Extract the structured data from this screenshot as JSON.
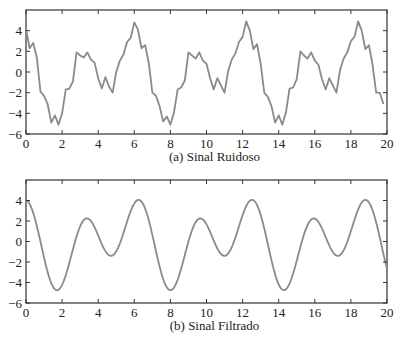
{
  "figure": {
    "width": 405,
    "height": 344,
    "line_color": "#8a8a8a",
    "axis_color": "#333333"
  },
  "chart_data": [
    {
      "type": "line",
      "title": "",
      "caption": "(a)  Sinal Ruidoso",
      "xlabel": "",
      "ylabel": "",
      "xlim": [
        0,
        20
      ],
      "ylim": [
        -6,
        6
      ],
      "grid": false,
      "xticks": [
        0,
        2,
        4,
        6,
        8,
        10,
        12,
        14,
        16,
        18,
        20
      ],
      "yticks": [
        -6,
        -4,
        -2,
        0,
        2,
        4
      ],
      "box": {
        "left": 26,
        "top": 10,
        "right": 387,
        "bottom": 134
      },
      "series": [
        {
          "name": "Sinal Ruidoso",
          "x": [
            0,
            0.2,
            0.4,
            0.6,
            0.8,
            1.0,
            1.2,
            1.4,
            1.6,
            1.8,
            2.0,
            2.2,
            2.4,
            2.6,
            2.8,
            3.0,
            3.2,
            3.4,
            3.6,
            3.8,
            4.0,
            4.2,
            4.4,
            4.6,
            4.8,
            5.0,
            5.2,
            5.4,
            5.6,
            5.8,
            6.0,
            6.2,
            6.4,
            6.6,
            6.8,
            7.0,
            7.2,
            7.4,
            7.6,
            7.8,
            8.0,
            8.2,
            8.4,
            8.6,
            8.8,
            9.0,
            9.2,
            9.4,
            9.6,
            9.8,
            10.0,
            10.2,
            10.4,
            10.6,
            10.8,
            11.0,
            11.2,
            11.4,
            11.6,
            11.8,
            12.0,
            12.2,
            12.4,
            12.6,
            12.8,
            13.0,
            13.2,
            13.4,
            13.6,
            13.8,
            14.0,
            14.2,
            14.4,
            14.6,
            14.8,
            15.0,
            15.2,
            15.4,
            15.6,
            15.8,
            16.0,
            16.2,
            16.4,
            16.6,
            16.8,
            17.0,
            17.2,
            17.4,
            17.6,
            17.8,
            18.0,
            18.2,
            18.4,
            18.6,
            18.8,
            19.0,
            19.2,
            19.4,
            19.6,
            19.8,
            20.0
          ],
          "y": [
            4.2,
            2.3,
            2.8,
            1.4,
            -1.9,
            -2.3,
            -3.1,
            -4.9,
            -4.2,
            -5.1,
            -4.0,
            -1.7,
            -1.6,
            -0.9,
            1.9,
            1.6,
            1.4,
            1.9,
            1.2,
            0.9,
            -0.6,
            -1.6,
            -0.5,
            -1.4,
            -2.0,
            0.0,
            1.1,
            1.7,
            2.9,
            3.3,
            4.8,
            4.1,
            2.3,
            2.6,
            0.9,
            -2.0,
            -2.3,
            -3.3,
            -4.8,
            -4.3,
            -5.1,
            -3.9,
            -1.7,
            -1.5,
            -0.8,
            1.9,
            1.6,
            1.3,
            1.9,
            1.1,
            0.8,
            -0.6,
            -1.7,
            -0.6,
            -1.3,
            -2.0,
            0.1,
            1.2,
            1.8,
            2.9,
            3.4,
            4.9,
            4.0,
            2.2,
            2.7,
            0.8,
            -2.0,
            -2.4,
            -3.3,
            -4.9,
            -4.2,
            -5.1,
            -3.9,
            -1.6,
            -1.5,
            -0.7,
            2.0,
            1.6,
            1.3,
            1.9,
            1.1,
            0.7,
            -0.7,
            -1.7,
            -0.6,
            -1.3,
            -2.0,
            0.2,
            1.3,
            1.9,
            3.0,
            3.4,
            4.9,
            4.0,
            2.2,
            2.6,
            0.7,
            -2.0,
            -2.0,
            -3.1
          ]
        }
      ]
    },
    {
      "type": "line",
      "title": "",
      "caption": "(b)  Sinal Filtrado",
      "xlabel": "",
      "ylabel": "",
      "xlim": [
        0,
        20
      ],
      "ylim": [
        -6,
        6
      ],
      "grid": false,
      "xticks": [
        0,
        2,
        4,
        6,
        8,
        10,
        12,
        14,
        16,
        18,
        20
      ],
      "yticks": [
        -6,
        -4,
        -2,
        0,
        2,
        4
      ],
      "box": {
        "left": 26,
        "top": 180,
        "right": 387,
        "bottom": 303
      },
      "series": [
        {
          "name": "Sinal Filtrado",
          "formula_coeffs": {
            "a1": 1.05,
            "b1": -1.6,
            "a2": 3.0,
            "b2": 0.5
          },
          "x_range": [
            0,
            20
          ],
          "samples": 400
        }
      ]
    }
  ]
}
